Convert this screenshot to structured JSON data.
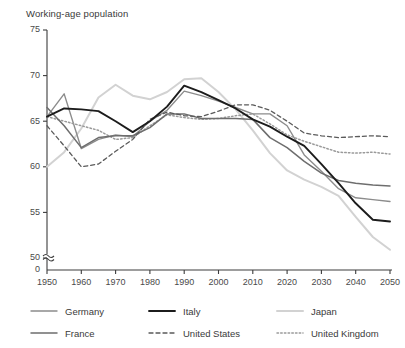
{
  "chart_data": {
    "type": "line",
    "title": "Working-age population",
    "xlabel": "",
    "ylabel": "",
    "xlim": [
      1950,
      2050
    ],
    "ylim": [
      50,
      75
    ],
    "y_axis_break": true,
    "y_break_label": "0",
    "grid": false,
    "legend_position": "bottom",
    "xticks": [
      1950,
      1960,
      1970,
      1980,
      1990,
      2000,
      2010,
      2020,
      2030,
      2040,
      2050
    ],
    "xtick_labels": [
      "1950",
      "1960",
      "1970",
      "1980",
      "1990",
      "2000",
      "2010",
      "2020",
      "2030",
      "2040",
      "2050"
    ],
    "yticks": [
      50,
      55,
      60,
      65,
      70,
      75
    ],
    "ytick_labels": [
      "50",
      "55",
      "60",
      "65",
      "70",
      "75"
    ],
    "series": [
      {
        "name": "Germany",
        "color": "#8c8c8c",
        "dash": "none",
        "width": 1.4,
        "x": [
          1950,
          1955,
          1960,
          1965,
          1970,
          1975,
          1980,
          1985,
          1990,
          1995,
          2000,
          2005,
          2010,
          2015,
          2020,
          2025,
          2030,
          2035,
          2040,
          2045,
          2050
        ],
        "values": [
          65.5,
          68.0,
          62.0,
          63.0,
          63.5,
          63.3,
          65.0,
          66.2,
          68.3,
          67.8,
          67.2,
          66.5,
          65.8,
          65.8,
          64.5,
          61.3,
          59.5,
          57.6,
          56.6,
          56.4,
          56.2
        ]
      },
      {
        "name": "Italy",
        "color": "#1c1c1c",
        "dash": "none",
        "width": 1.9,
        "x": [
          1950,
          1955,
          1960,
          1965,
          1970,
          1975,
          1980,
          1985,
          1990,
          1995,
          2000,
          2005,
          2010,
          2015,
          2020,
          2025,
          2030,
          2035,
          2040,
          2045,
          2050
        ],
        "values": [
          65.5,
          66.4,
          66.3,
          66.1,
          65.0,
          63.8,
          65.0,
          66.6,
          68.9,
          68.2,
          67.3,
          66.4,
          65.2,
          64.4,
          63.3,
          62.3,
          60.3,
          58.2,
          56.0,
          54.2,
          54.0
        ]
      },
      {
        "name": "Japan",
        "color": "#d2d2d2",
        "dash": "none",
        "width": 2.0,
        "x": [
          1950,
          1955,
          1960,
          1965,
          1970,
          1975,
          1980,
          1985,
          1990,
          1995,
          2000,
          2005,
          2010,
          2015,
          2020,
          2025,
          2030,
          2035,
          2040,
          2045,
          2050
        ],
        "values": [
          60.0,
          61.6,
          64.2,
          67.6,
          69.0,
          67.8,
          67.4,
          68.2,
          69.6,
          69.7,
          68.2,
          66.3,
          64.0,
          61.5,
          59.6,
          58.6,
          57.8,
          56.8,
          54.5,
          52.3,
          50.9
        ]
      },
      {
        "name": "France",
        "color": "#6e6e6e",
        "dash": "none",
        "width": 1.5,
        "x": [
          1950,
          1955,
          1960,
          1965,
          1970,
          1975,
          1980,
          1985,
          1990,
          1995,
          2000,
          2005,
          2010,
          2015,
          2020,
          2025,
          2030,
          2035,
          2040,
          2045,
          2050
        ],
        "values": [
          66.5,
          64.5,
          62.1,
          63.2,
          63.4,
          63.4,
          64.3,
          65.8,
          65.8,
          65.3,
          65.3,
          65.3,
          65.2,
          63.2,
          62.1,
          60.6,
          59.3,
          58.5,
          58.2,
          58.0,
          57.9
        ]
      },
      {
        "name": "United States",
        "color": "#5a5a5a",
        "dash": "4,3",
        "width": 1.3,
        "x": [
          1950,
          1955,
          1960,
          1965,
          1970,
          1975,
          1980,
          1985,
          1990,
          1995,
          2000,
          2005,
          2010,
          2015,
          2020,
          2025,
          2030,
          2035,
          2040,
          2045,
          2050
        ],
        "values": [
          64.5,
          62.3,
          60.0,
          60.3,
          61.7,
          63.0,
          65.2,
          66.0,
          65.6,
          65.5,
          66.1,
          66.8,
          66.8,
          66.2,
          65.0,
          63.7,
          63.4,
          63.2,
          63.3,
          63.4,
          63.3
        ]
      },
      {
        "name": "United Kingdom",
        "color": "#9a9a9a",
        "dash": "1.5,2.2",
        "width": 1.5,
        "x": [
          1950,
          1955,
          1960,
          1965,
          1970,
          1975,
          1980,
          1985,
          1990,
          1995,
          2000,
          2005,
          2010,
          2015,
          2020,
          2025,
          2030,
          2035,
          2040,
          2045,
          2050
        ],
        "values": [
          65.5,
          65.0,
          64.5,
          64.0,
          63.0,
          63.2,
          64.5,
          65.7,
          65.4,
          65.2,
          65.3,
          65.6,
          65.8,
          64.7,
          63.5,
          62.8,
          62.2,
          61.6,
          61.5,
          61.6,
          61.4
        ]
      }
    ]
  },
  "legend": {
    "items": [
      {
        "label": "Germany",
        "series_index": 0
      },
      {
        "label": "Italy",
        "series_index": 1
      },
      {
        "label": "Japan",
        "series_index": 2
      },
      {
        "label": "France",
        "series_index": 3
      },
      {
        "label": "United States",
        "series_index": 4
      },
      {
        "label": "United Kingdom",
        "series_index": 5
      }
    ]
  }
}
